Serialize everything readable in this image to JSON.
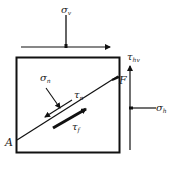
{
  "diagram": {
    "labels": {
      "sigma_v": "σ",
      "sigma_v_sub": "v",
      "tau_hv": "τ",
      "tau_hv_sub": "hv",
      "F": "F",
      "sigma_h": "σ",
      "sigma_h_sub": "h",
      "sigma_n": "σ",
      "sigma_n_sub": "n",
      "tau_n": "τ",
      "tau_n_sub": "n",
      "tau_f": "τ",
      "tau_f_sub": "f",
      "A": "A"
    },
    "colors": {
      "stroke": "#111111",
      "background": "#ffffff"
    }
  }
}
